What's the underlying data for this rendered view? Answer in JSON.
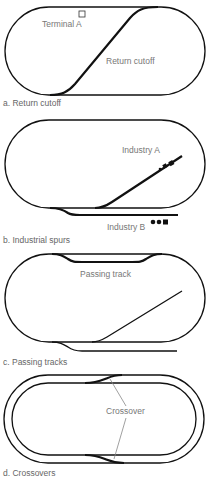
{
  "panels": [
    {
      "id": "a",
      "caption": "a. Return cutoff",
      "labels": {
        "terminal": "Terminal A",
        "cutoff": "Return cutoff"
      }
    },
    {
      "id": "b",
      "caption": "b. Industrial spurs",
      "labels": {
        "industry_a": "Industry A",
        "industry_b": "Industry B"
      }
    },
    {
      "id": "c",
      "caption": "c. Passing tracks",
      "labels": {
        "passing": "Passing track"
      }
    },
    {
      "id": "d",
      "caption": "d. Crossovers",
      "labels": {
        "crossover": "Crossover"
      }
    }
  ],
  "colors": {
    "track": "#111111",
    "label": "#777777",
    "leader": "#888888",
    "background": "#ffffff"
  }
}
